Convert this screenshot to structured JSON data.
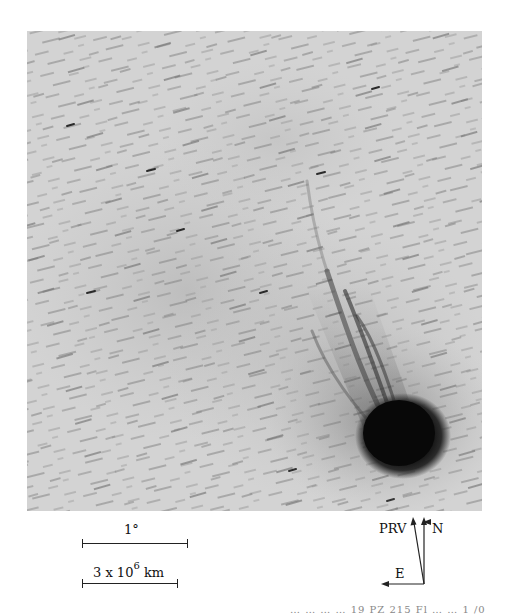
{
  "figure": {
    "photo": {
      "description": "comet photograph with ion tail streamers and trailed background stars",
      "comet_head_center": [
        403,
        440
      ],
      "background_gray": "#d2d2d2",
      "nucleus_color": "#0a0a0a"
    },
    "scale_bars": [
      {
        "label": "1°",
        "length_px": 106
      },
      {
        "label_base": "3 x 10",
        "label_exponent": "6",
        "label_unit": "km",
        "length_px": 96
      }
    ],
    "compass": {
      "labels": {
        "prv": "PRV",
        "north": "N",
        "east": "E"
      }
    },
    "footer_text": "… … … … 19 PZ 215 Fl … … 1 /0"
  }
}
